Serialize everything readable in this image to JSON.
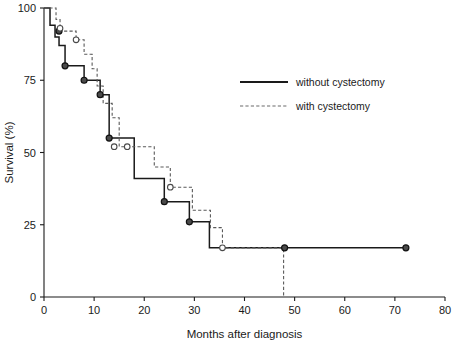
{
  "chart_data": {
    "type": "line",
    "title": "",
    "xlabel": "Months after diagnosis",
    "ylabel": "Survival (%)",
    "xlim": [
      0,
      80
    ],
    "ylim": [
      0,
      100
    ],
    "xticks": [
      0,
      10,
      20,
      30,
      40,
      50,
      60,
      70,
      80
    ],
    "xtick_labels": [
      "0",
      "10",
      "20",
      "30",
      "40",
      "50",
      "60",
      "70",
      "80"
    ],
    "yticks": [
      0,
      25,
      50,
      75,
      100
    ],
    "ytick_labels": [
      "0",
      "25",
      "50",
      "75",
      "100"
    ],
    "grid": false,
    "legend_position": "upper right",
    "plot_kind": "kaplan-meier-step",
    "series": [
      {
        "name": "without cystectomy",
        "style": "solid",
        "color": "#1a1a1a",
        "steps": [
          [
            0,
            100
          ],
          [
            1.2,
            100
          ],
          [
            1.2,
            94
          ],
          [
            2.2,
            94
          ],
          [
            2.2,
            90
          ],
          [
            3.0,
            90
          ],
          [
            3.0,
            87
          ],
          [
            4.2,
            87
          ],
          [
            4.2,
            80
          ],
          [
            8.0,
            80
          ],
          [
            8.0,
            75
          ],
          [
            11.2,
            75
          ],
          [
            11.2,
            70
          ],
          [
            13.0,
            70
          ],
          [
            13.0,
            55
          ],
          [
            18.0,
            55
          ],
          [
            18.0,
            41
          ],
          [
            24.0,
            41
          ],
          [
            24.0,
            33
          ],
          [
            29.0,
            33
          ],
          [
            29.0,
            26
          ],
          [
            33.0,
            26
          ],
          [
            33.0,
            17
          ],
          [
            72.2,
            17
          ]
        ],
        "censored_points": [
          [
            3.0,
            92
          ],
          [
            4.2,
            80
          ],
          [
            8.0,
            75
          ],
          [
            11.2,
            70
          ],
          [
            13.0,
            55
          ],
          [
            24.0,
            33
          ],
          [
            29.0,
            26
          ],
          [
            48.0,
            17
          ],
          [
            72.2,
            17
          ]
        ],
        "censor_marker": "filled-circle"
      },
      {
        "name": "with cystectomy",
        "style": "dashed",
        "color": "#5a5a5a",
        "steps": [
          [
            0,
            100
          ],
          [
            2.4,
            100
          ],
          [
            2.4,
            96
          ],
          [
            3.2,
            96
          ],
          [
            3.2,
            92
          ],
          [
            6.4,
            92
          ],
          [
            6.4,
            89
          ],
          [
            8.0,
            89
          ],
          [
            8.0,
            84
          ],
          [
            9.6,
            84
          ],
          [
            9.6,
            79
          ],
          [
            10.6,
            79
          ],
          [
            10.6,
            73
          ],
          [
            11.8,
            73
          ],
          [
            11.8,
            67
          ],
          [
            13.6,
            67
          ],
          [
            13.6,
            62
          ],
          [
            15.0,
            62
          ],
          [
            15.0,
            52
          ],
          [
            22.0,
            52
          ],
          [
            22.0,
            45
          ],
          [
            25.2,
            45
          ],
          [
            25.2,
            38
          ],
          [
            29.6,
            38
          ],
          [
            29.6,
            30
          ],
          [
            33.2,
            30
          ],
          [
            33.2,
            24
          ],
          [
            35.6,
            24
          ],
          [
            35.6,
            17
          ],
          [
            47.8,
            17
          ],
          [
            47.8,
            0
          ]
        ],
        "censored_points": [
          [
            3.2,
            93
          ],
          [
            6.4,
            89
          ],
          [
            14.0,
            52
          ],
          [
            16.6,
            52
          ],
          [
            25.2,
            38
          ],
          [
            35.6,
            17
          ]
        ],
        "censor_marker": "open-circle"
      }
    ],
    "annotations": [
      {
        "text": "dashed curve drops to 0% at 48 months",
        "x": 48,
        "y": 0
      }
    ]
  },
  "legend": {
    "entries": [
      {
        "label": "without cystectomy",
        "style": "solid"
      },
      {
        "label": "with cystectomy",
        "style": "dashed"
      }
    ]
  }
}
